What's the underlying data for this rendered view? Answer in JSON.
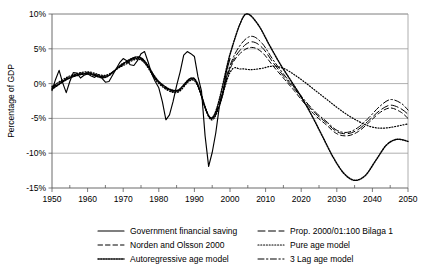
{
  "chart_data": {
    "type": "line",
    "title": "",
    "xlabel": "",
    "ylabel": "Percentage of GDP",
    "xlim": [
      1950,
      2050
    ],
    "ylim": [
      -15,
      10
    ],
    "ytick_labels": [
      "10%",
      "5%",
      "0%",
      "-5%",
      "-10%",
      "-15%"
    ],
    "ytick_values": [
      10,
      5,
      0,
      -5,
      -10,
      -15
    ],
    "xtick_labels": [
      "1950",
      "1960",
      "1970",
      "1980",
      "1990",
      "2000",
      "2010",
      "2020",
      "2030",
      "2040",
      "2050"
    ],
    "xtick_values": [
      1950,
      1960,
      1970,
      1980,
      1990,
      2000,
      2010,
      2020,
      2030,
      2040,
      2050
    ],
    "minor_xtick_values": [
      1955,
      1965,
      1975,
      1985,
      1995,
      2005,
      2015,
      2025,
      2035,
      2045
    ],
    "grid": "horizontal",
    "legend_position": "bottom",
    "series": [
      {
        "name": "Government financial saving",
        "style": "solid",
        "x": [
          1950,
          1951,
          1952,
          1953,
          1954,
          1955,
          1956,
          1957,
          1958,
          1959,
          1960,
          1961,
          1962,
          1963,
          1964,
          1965,
          1966,
          1967,
          1968,
          1969,
          1970,
          1971,
          1972,
          1973,
          1974,
          1975,
          1976,
          1977,
          1978,
          1979,
          1980,
          1981,
          1982,
          1983,
          1984,
          1985,
          1986,
          1987,
          1988,
          1989,
          1990,
          1991,
          1992,
          1993,
          1994,
          1995,
          1996,
          1997,
          1998,
          1999,
          2000
        ],
        "y": [
          -1.0,
          0.6,
          1.9,
          0.1,
          -1.3,
          0.3,
          1.6,
          1.5,
          0.8,
          1.2,
          1.4,
          1.1,
          0.9,
          1.3,
          0.8,
          0.2,
          0.3,
          1.2,
          2.1,
          3.0,
          3.6,
          3.3,
          2.7,
          2.6,
          3.3,
          4.3,
          4.6,
          3.1,
          1.4,
          0.3,
          -0.6,
          -2.6,
          -5.2,
          -4.5,
          -2.6,
          -0.3,
          1.7,
          4.1,
          4.6,
          4.3,
          3.9,
          1.0,
          -1.1,
          -7.5,
          -11.9,
          -9.9,
          -7.1,
          -3.3,
          -1.5,
          1.8,
          3.6
        ]
      },
      {
        "name": "Prop. 2000/01:100 Bilaga 1",
        "style": "longdash",
        "x": [
          1950,
          1955,
          1960,
          1965,
          1970,
          1975,
          1980,
          1985,
          1990,
          1995,
          2000,
          2003,
          2006,
          2009,
          2012,
          2015,
          2018,
          2021,
          2024,
          2027,
          2030,
          2033,
          2036,
          2039,
          2042,
          2045,
          2048,
          2050
        ],
        "y": [
          -0.6,
          0.9,
          1.5,
          1.1,
          2.8,
          3.6,
          0.2,
          -1.1,
          0.6,
          -5.0,
          2.3,
          4.9,
          6.0,
          5.2,
          3.1,
          1.1,
          -0.7,
          -2.6,
          -4.3,
          -5.6,
          -6.9,
          -7.2,
          -6.6,
          -5.3,
          -3.9,
          -3.1,
          -3.6,
          -4.4
        ]
      },
      {
        "name": "Norden and Olsson 2000",
        "style": "dash",
        "x": [
          1950,
          1955,
          1960,
          1965,
          1970,
          1975,
          1980,
          1985,
          1990,
          1995,
          2000,
          2003,
          2006,
          2009,
          2012,
          2015,
          2018,
          2021,
          2024,
          2027,
          2030,
          2033,
          2036,
          2039,
          2042,
          2045,
          2048,
          2050
        ],
        "y": [
          -0.5,
          1.0,
          1.6,
          1.0,
          2.7,
          3.5,
          0.1,
          -1.2,
          0.5,
          -5.1,
          2.1,
          4.4,
          5.2,
          4.5,
          2.6,
          0.8,
          -1.0,
          -2.9,
          -4.6,
          -5.9,
          -7.2,
          -7.5,
          -6.9,
          -5.6,
          -4.2,
          -3.5,
          -4.1,
          -5.0
        ]
      },
      {
        "name": "Pure age model",
        "style": "dot",
        "x": [
          1950,
          1955,
          1960,
          1965,
          1970,
          1975,
          1980,
          1985,
          1990,
          1995,
          2000,
          2003,
          2006,
          2009,
          2012,
          2015,
          2018,
          2021,
          2024,
          2027,
          2030,
          2033,
          2036,
          2039,
          2042,
          2045,
          2048,
          2050
        ],
        "y": [
          -0.4,
          1.1,
          1.7,
          1.2,
          2.6,
          3.4,
          0.0,
          -1.3,
          0.4,
          -5.2,
          1.6,
          2.1,
          2.0,
          2.2,
          2.5,
          2.2,
          1.3,
          0.2,
          -1.0,
          -2.2,
          -3.4,
          -4.5,
          -5.4,
          -6.1,
          -6.4,
          -6.3,
          -6.0,
          -5.8
        ]
      },
      {
        "name": "Autoregressive age model",
        "style": "plusdot",
        "x": [
          1950,
          1955,
          1960,
          1965,
          1970,
          1975,
          1980,
          1985,
          1990,
          1995,
          2000,
          2003,
          2005,
          2008,
          2011,
          2014,
          2017,
          2020,
          2023,
          2026,
          2029,
          2032,
          2035,
          2038,
          2041,
          2044,
          2047,
          2050
        ],
        "y": [
          -0.8,
          0.8,
          1.4,
          0.9,
          2.9,
          3.7,
          0.3,
          -1.0,
          0.7,
          -4.9,
          4.2,
          8.8,
          10.0,
          8.4,
          5.6,
          2.9,
          0.5,
          -1.9,
          -4.6,
          -7.6,
          -10.6,
          -12.9,
          -13.9,
          -13.2,
          -11.0,
          -8.8,
          -8.0,
          -8.3
        ]
      },
      {
        "name": "3 Lag age model",
        "style": "dashdot",
        "x": [
          1950,
          1955,
          1960,
          1965,
          1970,
          1975,
          1980,
          1985,
          1990,
          1995,
          2000,
          2003,
          2006,
          2009,
          2012,
          2015,
          2018,
          2021,
          2024,
          2027,
          2030,
          2033,
          2036,
          2039,
          2042,
          2045,
          2048,
          2050
        ],
        "y": [
          -0.7,
          0.9,
          1.5,
          1.0,
          2.8,
          3.6,
          0.2,
          -1.1,
          0.6,
          -5.0,
          2.6,
          5.6,
          6.8,
          5.8,
          3.5,
          1.4,
          -0.5,
          -2.4,
          -4.1,
          -5.4,
          -6.7,
          -7.0,
          -6.3,
          -4.9,
          -3.3,
          -2.3,
          -2.8,
          -3.8
        ]
      }
    ],
    "legend_entries": [
      {
        "label": "Government financial saving",
        "style": "solid"
      },
      {
        "label": "Prop. 2000/01:100 Bilaga 1",
        "style": "longdash"
      },
      {
        "label": "Norden and Olsson 2000",
        "style": "dash"
      },
      {
        "label": "Pure age model",
        "style": "dot"
      },
      {
        "label": "Autoregressive age model",
        "style": "plusdot"
      },
      {
        "label": "3 Lag age model",
        "style": "dashdot"
      }
    ]
  }
}
